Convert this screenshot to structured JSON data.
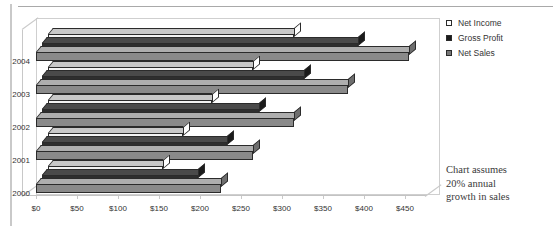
{
  "chart_data": {
    "type": "bar",
    "orientation": "horizontal",
    "style": "3d-clustered-bar",
    "title": "",
    "xlabel": "",
    "ylabel": "",
    "categories": [
      "2000",
      "2001",
      "2002",
      "2003",
      "2004"
    ],
    "series": [
      {
        "name": "Net Income",
        "key": "net_income",
        "color": "#f2f2f2",
        "values": [
          140,
          165,
          200,
          250,
          300
        ]
      },
      {
        "name": "Gross Profit",
        "key": "gross_profit",
        "color": "#2e2e2e",
        "values": [
          190,
          225,
          265,
          320,
          385
        ]
      },
      {
        "name": "Net Sales",
        "key": "net_sales",
        "color": "#8a8a8a",
        "values": [
          225,
          265,
          315,
          380,
          455
        ]
      }
    ],
    "xlim": [
      0,
      475
    ],
    "xticks": [
      0,
      50,
      100,
      150,
      200,
      250,
      300,
      350,
      400,
      450
    ],
    "xtick_labels": [
      "$0",
      "$50",
      "$100",
      "$150",
      "$200",
      "$250",
      "$300",
      "$350",
      "$400",
      "$450"
    ],
    "grid": false,
    "legend_position": "right-top",
    "annotations": [
      "Chart assumes",
      "20% annual",
      "growth in sales"
    ]
  },
  "legend": {
    "items": [
      {
        "label": "Net Income",
        "marker": "square-outline-icon",
        "color": "#ffffff"
      },
      {
        "label": "Gross Profit",
        "marker": "square-filled-icon",
        "color": "#1b1b1b"
      },
      {
        "label": "Net Sales",
        "marker": "square-gray-icon",
        "color": "#777777"
      }
    ]
  },
  "note": {
    "line1": "Chart assumes",
    "line2": "20% annual",
    "line3": "growth in sales"
  }
}
